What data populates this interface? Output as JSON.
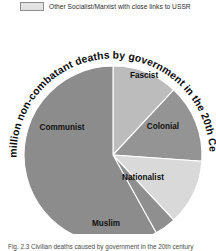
{
  "figure": {
    "background_color": "#ffffff",
    "width": 216,
    "height": 250
  },
  "legend": {
    "items": [
      {
        "label": "Islamic state",
        "swatch_color": "#9a9a9a",
        "swatch_border": "#8d8d8d",
        "clipped": true
      },
      {
        "label": "Other Socialist/Marxist with close links to USSR",
        "swatch_color": "#e2e2e2",
        "swatch_border": "#8d8d8d",
        "clipped": false
      }
    ]
  },
  "caption": {
    "prefix": "Fig. 2.3",
    "text": "Fig. 2.3 Civilian deaths caused by government in the 20th century"
  },
  "chart_data": {
    "type": "pie",
    "title": "275 million non-combatant deaths by government in the 20th Century",
    "title_style": "curved around pie",
    "xlabel": "",
    "ylabel": "",
    "grid": false,
    "legend_position": "top",
    "total_label": "275 million",
    "categories": [
      "Fascist",
      "Colonial",
      "Nationalist",
      "Muslim",
      "Communist"
    ],
    "values": [
      12,
      14,
      12,
      4,
      58
    ],
    "units": "percent of 275 million non-combatant deaths",
    "slices": [
      {
        "label": "Fascist",
        "value": 12,
        "color": "#bcbcbc",
        "start_deg": 0,
        "end_deg": 43
      },
      {
        "label": "Colonial",
        "value": 14,
        "color": "#949494",
        "start_deg": 43,
        "end_deg": 94
      },
      {
        "label": "Nationalist",
        "value": 12,
        "color": "#d9d9d9",
        "start_deg": 94,
        "end_deg": 137
      },
      {
        "label": "Muslim",
        "value": 4,
        "color": "#8f8f8f",
        "start_deg": 137,
        "end_deg": 151
      },
      {
        "label": "Communist",
        "value": 58,
        "color": "#8c8c8c",
        "start_deg": 151,
        "end_deg": 360
      }
    ]
  }
}
